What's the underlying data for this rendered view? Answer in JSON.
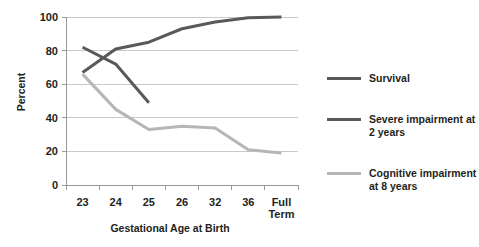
{
  "chart_data": {
    "type": "line",
    "title": "",
    "xlabel": "Gestational Age at Birth",
    "ylabel": "Percent",
    "categories": [
      "23",
      "24",
      "25",
      "26",
      "32",
      "36",
      "Full\nTerm"
    ],
    "category_labels": [
      "23",
      "24",
      "25",
      "26",
      "32",
      "36",
      "Full Term"
    ],
    "ylim": [
      0,
      100
    ],
    "yticks": [
      0,
      20,
      40,
      60,
      80,
      100
    ],
    "grid": true,
    "legend_position": "right",
    "series": [
      {
        "name": "Survival",
        "color": "#595959",
        "values": [
          67,
          81,
          85,
          93,
          97,
          99.5,
          100
        ]
      },
      {
        "name": "Severe impairment at 2 years",
        "color": "#595959",
        "values": [
          82,
          72,
          49,
          null,
          null,
          null,
          null
        ]
      },
      {
        "name": "Cognitive impairment at 8 years",
        "color": "#b6b6b6",
        "values": [
          66,
          45,
          33,
          35,
          34,
          21,
          19
        ]
      }
    ]
  },
  "legend": {
    "items": [
      {
        "label": "Survival",
        "color": "#595959"
      },
      {
        "label": "Severe impairment at 2 years",
        "color": "#595959"
      },
      {
        "label": "Cognitive impairment at 8 years",
        "color": "#b6b6b6"
      }
    ]
  },
  "axes": {
    "y_title": "Percent",
    "x_title": "Gestational Age at Birth",
    "y_tick_labels": [
      "100",
      "80",
      "60",
      "40",
      "20",
      "0"
    ],
    "x_tick_labels": [
      "23",
      "24",
      "25",
      "26",
      "32",
      "36",
      "Full Term"
    ]
  },
  "colors": {
    "dark_line": "#595959",
    "light_line": "#b6b6b6",
    "grid": "#c9c9c9",
    "axis": "#9a9a9a",
    "text": "#231f20",
    "background": "#ffffff"
  }
}
